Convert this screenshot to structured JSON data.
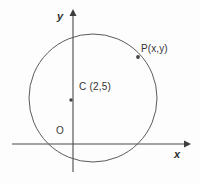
{
  "figure": {
    "background_color": "#fdfdfd",
    "stroke_color": "#4a4a4a",
    "text_color": "#333333"
  },
  "axes": {
    "x_axis": {
      "label": "x",
      "label_x": 178,
      "label_y": 155,
      "line_y": 144,
      "line_x_start": 12,
      "line_x_end": 188,
      "arrow": "right"
    },
    "y_axis": {
      "label": "y",
      "label_x": 62,
      "label_y": 18,
      "line_x": 73,
      "line_y_start": 12,
      "line_y_end": 172,
      "arrow": "up"
    },
    "origin": {
      "label": "O",
      "label_x": 60,
      "label_y": 132,
      "x": 73,
      "y": 144
    }
  },
  "circle": {
    "center_x": 93,
    "center_y": 98,
    "radius": 64,
    "stroke_width": 1
  },
  "center_point": {
    "label": "C (2,5)",
    "label_x": 80,
    "label_y": 88,
    "marker_x": 71,
    "marker_y": 100,
    "coordinates": [
      2,
      5
    ]
  },
  "circumference_point": {
    "label": "P(x,y)",
    "label_x": 142,
    "label_y": 50,
    "marker_x": 138,
    "marker_y": 57
  },
  "chart_data": {
    "type": "scatter",
    "xlabel": "x",
    "ylabel": "y",
    "grid": false,
    "legend": "none",
    "annotations": [
      "y",
      "x",
      "O",
      "C (2,5)",
      "P(x,y)"
    ],
    "shapes": [
      {
        "kind": "circle",
        "center": [
          2,
          5
        ],
        "radius": 5.2,
        "label": "circle"
      }
    ],
    "points": [
      {
        "name": "C",
        "label": "C (2,5)",
        "x": 2,
        "y": 5
      },
      {
        "name": "P",
        "label": "P(x,y)",
        "x": 5.6,
        "y": 8.6
      },
      {
        "name": "O",
        "label": "O",
        "x": 0,
        "y": 0
      }
    ]
  }
}
